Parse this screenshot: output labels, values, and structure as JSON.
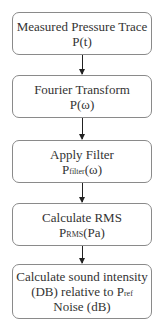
{
  "diagram": {
    "type": "flowchart",
    "direction": "top-to-bottom",
    "colors": {
      "border": "#8a8a8a",
      "arrow": "#222222",
      "text": "#333333",
      "background": "#ffffff"
    },
    "steps": [
      {
        "title": "Measured Pressure Trace",
        "symbol": "P",
        "subscript": "",
        "arg": "(t)"
      },
      {
        "title": "Fourier Transform",
        "symbol": "P",
        "subscript": "",
        "arg": "(ω)"
      },
      {
        "title": "Apply Filter",
        "symbol": "P",
        "subscript": "filter",
        "arg": "(ω)"
      },
      {
        "title": "Calculate RMS",
        "symbol": "P",
        "subscript": "RMS",
        "arg": "(Pa)"
      },
      {
        "title": "Calculate sound intensity",
        "line2_prefix": "(DB) relative to P",
        "line2_sub": "ref",
        "line3": "Noise (dB)"
      }
    ],
    "connections": [
      {
        "from": 0,
        "to": 1
      },
      {
        "from": 1,
        "to": 2
      },
      {
        "from": 2,
        "to": 3
      },
      {
        "from": 3,
        "to": 4
      }
    ]
  }
}
